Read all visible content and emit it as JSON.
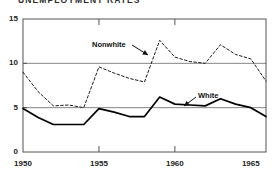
{
  "chart_data": {
    "type": "line",
    "title": "UNEMPLOYMENT RATES",
    "xlabel": "",
    "ylabel": "",
    "xlim": [
      1950,
      1966
    ],
    "ylim": [
      0,
      15
    ],
    "grid": true,
    "gridlines_y": [
      5,
      10
    ],
    "legend_position": "inline-annotation",
    "yticks": [
      0,
      5,
      10,
      15
    ],
    "ytick_labels": [
      "0",
      "5",
      "10",
      "15"
    ],
    "xticks": [
      1950,
      1955,
      1960,
      1965
    ],
    "xtick_labels": [
      "1950",
      "1955",
      "1960",
      "1965"
    ],
    "x": [
      1950,
      1951,
      1952,
      1953,
      1954,
      1955,
      1956,
      1957,
      1958,
      1959,
      1960,
      1961,
      1962,
      1963,
      1964,
      1965,
      1966
    ],
    "series": [
      {
        "name": "Nonwhite",
        "style": "dashed",
        "values": [
          9.0,
          6.8,
          5.2,
          5.3,
          5.0,
          9.6,
          8.9,
          8.3,
          7.9,
          12.6,
          10.7,
          10.2,
          10.0,
          12.1,
          11.0,
          10.5,
          8.0
        ]
      },
      {
        "name": "White",
        "style": "solid",
        "values": [
          4.9,
          3.9,
          3.1,
          3.1,
          3.1,
          4.9,
          4.5,
          4.0,
          4.0,
          6.2,
          5.4,
          5.3,
          5.2,
          6.0,
          5.4,
          5.0,
          4.0
        ]
      }
    ],
    "annotations": [
      {
        "label": "Nonwhite",
        "points_to_year": 1958
      },
      {
        "label": "White",
        "points_to_year": 1959
      }
    ]
  },
  "colors": {
    "axis": "#555555",
    "gridline": "#777777",
    "nonwhite_line": "#1a1a1a",
    "white_line": "#000000",
    "text": "#1a1a1a",
    "background": "#ffffff"
  }
}
